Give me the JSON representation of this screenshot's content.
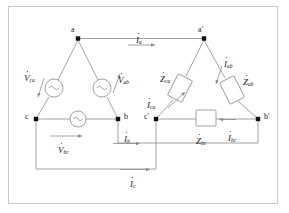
{
  "figure": {
    "frame_color": "#c9c9c9",
    "line_color": "#8a8a8a",
    "text_color": "#1a1a1a"
  },
  "nodes": [
    {
      "id": "a",
      "label": "a",
      "x": 78,
      "y": 38
    },
    {
      "id": "b",
      "label": "b",
      "x": 118,
      "y": 119
    },
    {
      "id": "c",
      "label": "c",
      "x": 36,
      "y": 119
    },
    {
      "id": "ap",
      "label": "a'",
      "x": 204,
      "y": 38
    },
    {
      "id": "bp",
      "label": "b'",
      "x": 258,
      "y": 119
    },
    {
      "id": "cp",
      "label": "c'",
      "x": 156,
      "y": 119
    }
  ],
  "sources": [
    {
      "name": "source-ca",
      "label_base": "V",
      "label_sub": "ca",
      "glyph": "ac-source-icon"
    },
    {
      "name": "source-ab",
      "label_base": "V",
      "label_sub": "ab",
      "glyph": "ac-source-icon"
    },
    {
      "name": "source-bc",
      "label_base": "V",
      "label_sub": "bc",
      "glyph": "ac-source-icon"
    }
  ],
  "impedances": [
    {
      "name": "impedance-ca",
      "label_base": "Z",
      "label_sub": "ca"
    },
    {
      "name": "impedance-ab",
      "label_base": "Z",
      "label_sub": "ab"
    },
    {
      "name": "impedance-bc",
      "label_base": "Z",
      "label_sub": "bc"
    }
  ],
  "currents": [
    {
      "name": "current-a",
      "label_base": "I",
      "label_sub": "a"
    },
    {
      "name": "current-b",
      "label_base": "I",
      "label_sub": "b"
    },
    {
      "name": "current-c",
      "label_base": "I",
      "label_sub": "c"
    },
    {
      "name": "current-ab",
      "label_base": "I",
      "label_sub": "ab"
    },
    {
      "name": "current-bc",
      "label_base": "I",
      "label_sub": "bc"
    },
    {
      "name": "current-ca",
      "label_base": "I",
      "label_sub": "ca"
    }
  ],
  "labels": {
    "node_a": "a",
    "node_b": "b",
    "node_c": "c",
    "node_ap": "a'",
    "node_bp": "b'",
    "node_cp": "c'",
    "V": "V",
    "Z": "Z",
    "I": "I",
    "sub_ca": "ca",
    "sub_ab": "ab",
    "sub_bc": "bc",
    "sub_a": "a",
    "sub_b": "b",
    "sub_c": "c"
  }
}
